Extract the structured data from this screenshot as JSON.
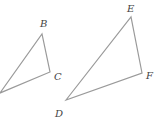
{
  "diagram": {
    "type": "similar-triangles",
    "stroke_color": "#9a9a9a",
    "label_color": "#444444",
    "triangles": [
      {
        "name": "triangle-ABC",
        "vertices": [
          {
            "label": "",
            "x": 0,
            "y": 93
          },
          {
            "label": "B",
            "x": 42,
            "y": 34
          },
          {
            "label": "C",
            "x": 50,
            "y": 72
          }
        ],
        "labels": [
          {
            "text": "B",
            "x": 40,
            "y": 27
          },
          {
            "text": "C",
            "x": 54,
            "y": 80
          }
        ]
      },
      {
        "name": "triangle-DEF",
        "vertices": [
          {
            "label": "D",
            "x": 66,
            "y": 100
          },
          {
            "label": "E",
            "x": 131,
            "y": 17
          },
          {
            "label": "F",
            "x": 142,
            "y": 73
          }
        ],
        "labels": [
          {
            "text": "E",
            "x": 127,
            "y": 12
          },
          {
            "text": "F",
            "x": 146,
            "y": 79
          },
          {
            "text": "D",
            "x": 55,
            "y": 117
          }
        ]
      }
    ]
  }
}
